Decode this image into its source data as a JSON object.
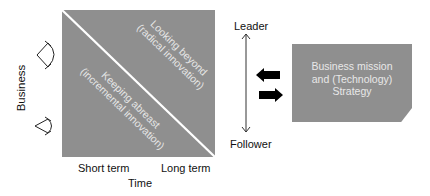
{
  "diagram": {
    "square": {
      "upper_region": {
        "line1": "Looking beyond",
        "line2": "(radical innovation)"
      },
      "lower_region": {
        "line1": "Keeping abreast",
        "line2": "(incremental innovation)"
      }
    },
    "axes": {
      "y_label": "Business",
      "x_label": "Time",
      "x_ticks": [
        "Short term",
        "Long term"
      ]
    },
    "scale": {
      "top": "Leader",
      "bottom": "Follower"
    },
    "box": {
      "line1": "Business mission",
      "line2": "and (Technology)",
      "line3": "Strategy"
    },
    "icons": [
      "wide-view-eye-icon",
      "narrow-view-eye-icon",
      "arrow-left-icon",
      "arrow-right-icon",
      "double-arrow-vertical-icon"
    ],
    "colors": {
      "fill": "#8f8f8f",
      "inner_text": "#e6e6e6",
      "divider": "#ffffff",
      "arrow": "#000000"
    }
  }
}
